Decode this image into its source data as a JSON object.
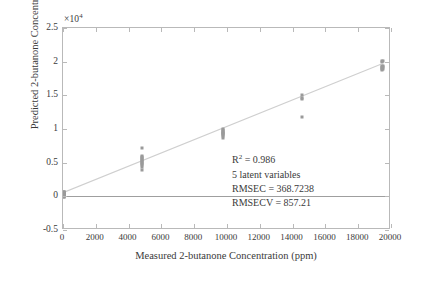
{
  "chart_data": {
    "type": "scatter",
    "title": "",
    "xlabel": "Measured 2-butanone Concentration (ppm)",
    "ylabel": "Predicted 2-butanone Concentration",
    "y_exponent_label": "×10",
    "y_exponent_power": "4",
    "xlim": [
      0,
      20000
    ],
    "ylim": [
      -5000,
      25000
    ],
    "xticks": [
      0,
      2000,
      4000,
      6000,
      8000,
      10000,
      12000,
      14000,
      16000,
      18000,
      20000
    ],
    "xtick_labels": [
      "0",
      "2000",
      "4000",
      "6000",
      "8000",
      "10000",
      "12000",
      "14000",
      "16000",
      "18000",
      "20000"
    ],
    "yticks": [
      -5000,
      0,
      5000,
      10000,
      15000,
      20000,
      25000
    ],
    "ytick_labels": [
      "-0.5",
      "0",
      "0.5",
      "1",
      "1.5",
      "2",
      "2.5"
    ],
    "grid": false,
    "legend": null,
    "marker_color": "#9a9a9a",
    "line_color": "#cfcfcf",
    "frame_color": "#b9b9b9",
    "zero_line_color": "#9f9f9f",
    "reference_lines": [
      {
        "name": "zero-baseline",
        "type": "horizontal",
        "y": 0
      },
      {
        "name": "regression-fit",
        "type": "linear",
        "x0": 0,
        "y0": 300,
        "x1": 19500,
        "y1": 19550
      }
    ],
    "series": [
      {
        "name": "calibration-samples",
        "marker": "dot",
        "points": [
          [
            60,
            700
          ],
          [
            60,
            620
          ],
          [
            60,
            540
          ],
          [
            60,
            470
          ],
          [
            60,
            400
          ],
          [
            60,
            330
          ],
          [
            60,
            260
          ],
          [
            60,
            190
          ],
          [
            60,
            110
          ],
          [
            60,
            40
          ],
          [
            60,
            -30
          ],
          [
            60,
            -110
          ],
          [
            90,
            600
          ],
          [
            90,
            450
          ],
          [
            90,
            300
          ],
          [
            90,
            150
          ],
          [
            90,
            20
          ],
          [
            4820,
            7200
          ],
          [
            4820,
            6000
          ],
          [
            4820,
            5850
          ],
          [
            4820,
            5700
          ],
          [
            4820,
            5560
          ],
          [
            4820,
            5420
          ],
          [
            4820,
            5280
          ],
          [
            4820,
            5140
          ],
          [
            4820,
            5000
          ],
          [
            4820,
            4860
          ],
          [
            4820,
            4700
          ],
          [
            4820,
            4350
          ],
          [
            4820,
            3950
          ],
          [
            9780,
            10050
          ],
          [
            9780,
            9900
          ],
          [
            9780,
            9760
          ],
          [
            9780,
            9620
          ],
          [
            9780,
            9480
          ],
          [
            9780,
            9340
          ],
          [
            9780,
            9200
          ],
          [
            9780,
            9060
          ],
          [
            9780,
            8900
          ],
          [
            9780,
            8720
          ],
          [
            14580,
            15050
          ],
          [
            14580,
            14600
          ],
          [
            14580,
            14450
          ],
          [
            14580,
            11800
          ],
          [
            19460,
            20150
          ],
          [
            19460,
            20000
          ],
          [
            19460,
            19400
          ],
          [
            19460,
            19250
          ],
          [
            19460,
            19100
          ],
          [
            19460,
            18950
          ],
          [
            19460,
            18800
          ],
          [
            19540,
            20050
          ],
          [
            19540,
            19350
          ],
          [
            19540,
            19150
          ],
          [
            19540,
            18900
          ]
        ]
      }
    ],
    "annotations": [
      {
        "name": "r-squared",
        "text": "R² = 0.986",
        "base": "R",
        "sup": "2",
        "rest": " = 0.986"
      },
      {
        "name": "latent-variables",
        "text": "5 latent variables"
      },
      {
        "name": "rmsec",
        "text": "RMSEC = 368.7238"
      },
      {
        "name": "rmsecv",
        "text": "RMSECV = 857.21"
      }
    ]
  }
}
